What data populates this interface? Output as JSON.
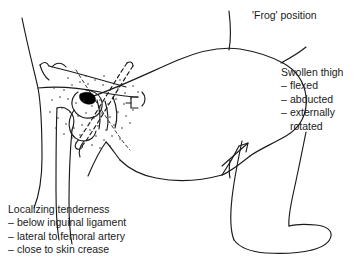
{
  "figure": {
    "kind": "medical-line-illustration",
    "background_color": "#ffffff",
    "ink_color": "#1a1a1a",
    "stipple_color": "#333333",
    "lesion_color": "#000000"
  },
  "title": {
    "text": "'Frog' position"
  },
  "thigh_annotation": {
    "heading": "Swollen thigh",
    "items": [
      {
        "dash": "–",
        "text": "flexed"
      },
      {
        "dash": "–",
        "text": "abducted"
      },
      {
        "dash": "–",
        "text": "externally"
      }
    ],
    "continuation": "rotated"
  },
  "tenderness_annotation": {
    "heading": "Localizing tenderness",
    "items": [
      {
        "dash": "–",
        "text": "below inguinal ligament"
      },
      {
        "dash": "–",
        "text": "lateral to femoral artery"
      },
      {
        "dash": "–",
        "text": "close to skin crease"
      }
    ]
  }
}
